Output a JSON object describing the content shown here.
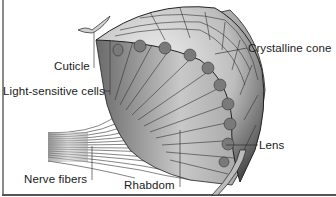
{
  "diagram": {
    "labels": {
      "cuticle": "Cuticle",
      "light_sensitive_cells": "Light-sensitive cells",
      "nerve_fibers": "Nerve fibers",
      "crystalline_cone": "Crystalline cone",
      "lens": "Lens",
      "rhabdom": "Rhabdom"
    },
    "colors": {
      "background": "#ffffff",
      "ink": "#1a1a1a",
      "shading_dark": "#4a4a4a",
      "shading_mid": "#9a9a9a",
      "shading_light": "#e0e0e0"
    }
  }
}
